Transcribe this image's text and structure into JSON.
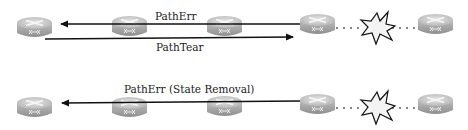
{
  "diagram": {
    "top_row": {
      "routers": [
        {
          "id": "r1",
          "x": 17
        },
        {
          "id": "r2",
          "x": 112
        },
        {
          "id": "r3",
          "x": 207
        },
        {
          "id": "r4",
          "x": 300
        },
        {
          "id": "r5",
          "x": 418
        }
      ],
      "arrows": [
        {
          "label": "PathErr",
          "direction": "left",
          "from_router": "r4",
          "to_router": "r1"
        },
        {
          "label": "PathTear",
          "direction": "right",
          "from_router": "r1",
          "to_router": "r4"
        }
      ],
      "failure": {
        "between": [
          "r4",
          "r5"
        ],
        "icon": "explosion-icon"
      }
    },
    "bottom_row": {
      "routers": [
        {
          "id": "r1",
          "x": 17
        },
        {
          "id": "r2",
          "x": 112
        },
        {
          "id": "r3",
          "x": 207
        },
        {
          "id": "r4",
          "x": 300
        },
        {
          "id": "r5",
          "x": 418
        }
      ],
      "arrows": [
        {
          "label": "PathErr (State Removal)",
          "direction": "left",
          "from_router": "r4",
          "to_router": "r1"
        }
      ],
      "failure": {
        "between": [
          "r4",
          "r5"
        ],
        "icon": "explosion-icon"
      }
    },
    "colors": {
      "line": "#111111",
      "router_top": "#d4d4d4",
      "router_side": "#a9a9a9",
      "burst_fill": "#f4f4f4"
    }
  }
}
